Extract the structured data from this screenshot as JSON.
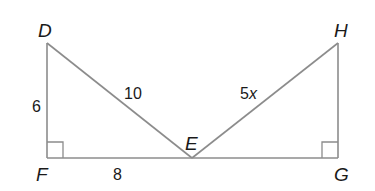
{
  "figure": {
    "type": "geometry-two-right-triangles",
    "line_color": "#8c8c8c",
    "text_color": "#1a1a1a"
  },
  "vertices": {
    "D": {
      "label": "D",
      "x": 47,
      "y": 43
    },
    "F": {
      "label": "F",
      "x": 47,
      "y": 158
    },
    "E": {
      "label": "E",
      "x": 192,
      "y": 158
    },
    "H": {
      "label": "H",
      "x": 338,
      "y": 43
    },
    "G": {
      "label": "G",
      "x": 338,
      "y": 158
    }
  },
  "segments": {
    "DF": {
      "label": "6"
    },
    "DE": {
      "label": "10"
    },
    "FE": {
      "label": "8"
    },
    "EH": {
      "label_num": "5",
      "label_var": "x"
    }
  },
  "right_angles": [
    "F",
    "G"
  ]
}
